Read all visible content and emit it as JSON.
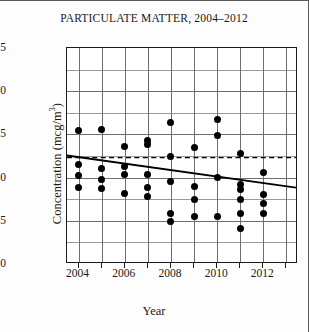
{
  "chart_data": {
    "type": "scatter",
    "title": "PARTICULATE MATTER, 2004–2012",
    "xlabel": "Year",
    "ylabel_prefix": "Concentration (mcg/m",
    "ylabel_sup": "3",
    "ylabel_suffix": ")",
    "ylabel": "Concentration (mcg/m³)",
    "xlim": [
      2003.5,
      2013.5
    ],
    "ylim": [
      0,
      25
    ],
    "yticks": [
      0,
      5,
      10,
      15,
      20,
      25
    ],
    "ytick_labels": [
      "0",
      "5",
      "10",
      "15",
      "20",
      "25"
    ],
    "xticks": [
      2004,
      2006,
      2008,
      2010,
      2012
    ],
    "xtick_labels": [
      "2004",
      "2006",
      "2008",
      "2010",
      "2012"
    ],
    "x_gridlines": [
      2004,
      2005,
      2006,
      2007,
      2008,
      2009,
      2010,
      2011,
      2012,
      2013
    ],
    "y_major_gridlines": [
      5,
      10,
      15,
      20
    ],
    "y_minor_gridlines": [
      2.5,
      7.5,
      12.5,
      17.5,
      22.5
    ],
    "grid": true,
    "legend": false,
    "marker_color": "#000000",
    "marker_shape": "filled-circle",
    "points": [
      {
        "x": 2004,
        "y": 15.4
      },
      {
        "x": 2004,
        "y": 11.5
      },
      {
        "x": 2004,
        "y": 10.2
      },
      {
        "x": 2004,
        "y": 8.9
      },
      {
        "x": 2005,
        "y": 15.6
      },
      {
        "x": 2005,
        "y": 11.0
      },
      {
        "x": 2005,
        "y": 9.8
      },
      {
        "x": 2005,
        "y": 8.7
      },
      {
        "x": 2006,
        "y": 13.6
      },
      {
        "x": 2006,
        "y": 11.3
      },
      {
        "x": 2006,
        "y": 10.4
      },
      {
        "x": 2006,
        "y": 8.2
      },
      {
        "x": 2007,
        "y": 14.3
      },
      {
        "x": 2007,
        "y": 13.8
      },
      {
        "x": 2007,
        "y": 10.4
      },
      {
        "x": 2007,
        "y": 8.9
      },
      {
        "x": 2007,
        "y": 7.8
      },
      {
        "x": 2008,
        "y": 16.4
      },
      {
        "x": 2008,
        "y": 12.5
      },
      {
        "x": 2008,
        "y": 9.6
      },
      {
        "x": 2008,
        "y": 5.9
      },
      {
        "x": 2008,
        "y": 4.9
      },
      {
        "x": 2009,
        "y": 13.5
      },
      {
        "x": 2009,
        "y": 9.0
      },
      {
        "x": 2009,
        "y": 7.5
      },
      {
        "x": 2009,
        "y": 5.5
      },
      {
        "x": 2010,
        "y": 16.7
      },
      {
        "x": 2010,
        "y": 14.9
      },
      {
        "x": 2010,
        "y": 10.0
      },
      {
        "x": 2010,
        "y": 5.5
      },
      {
        "x": 2011,
        "y": 12.8
      },
      {
        "x": 2011,
        "y": 9.2
      },
      {
        "x": 2011,
        "y": 8.6
      },
      {
        "x": 2011,
        "y": 7.5
      },
      {
        "x": 2011,
        "y": 5.9
      },
      {
        "x": 2011,
        "y": 4.1
      },
      {
        "x": 2012,
        "y": 10.6
      },
      {
        "x": 2012,
        "y": 8.0
      },
      {
        "x": 2012,
        "y": 7.0
      },
      {
        "x": 2012,
        "y": 5.9
      }
    ],
    "trend_line": {
      "style": "solid",
      "color": "#000000",
      "x_start": 2003.5,
      "y_start": 12.45,
      "x_end": 2013.5,
      "y_end": 8.7
    },
    "reference_line": {
      "style": "dashed",
      "color": "#000000",
      "y": 12.2,
      "x_start": 2003.5,
      "x_end": 2013.5
    }
  }
}
